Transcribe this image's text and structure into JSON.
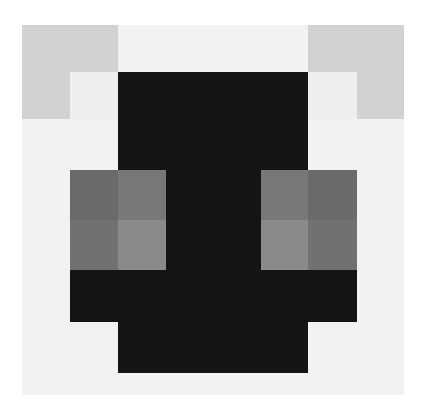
{
  "image": {
    "description": "Pixel-art grayscale icon of a dark face/creature with two gray eyes and light-gray ears",
    "palette": {
      "white": "#ffffff",
      "background": "#f2f2f2",
      "ear": "#d2d2d2",
      "ear_inner": "#eeeeee",
      "body": "#141414",
      "eye_dark": "#6a6a6a",
      "eye_mid": "#787878",
      "eye_light": "#8a8a8a",
      "eye_shade": "#717171"
    },
    "columns_x": [
      22,
      70,
      118,
      166,
      213,
      261,
      308,
      357,
      404
    ],
    "rows_y": [
      25,
      72,
      119,
      170,
      220,
      270,
      322,
      373
    ],
    "pixels": [
      {
        "name": "ear-left-top",
        "c": [
          0,
          2
        ],
        "r": [
          0,
          1
        ],
        "color": "ear"
      },
      {
        "name": "ear-left-side",
        "c": [
          0,
          1
        ],
        "r": [
          1,
          2
        ],
        "color": "ear"
      },
      {
        "name": "ear-left-inner",
        "c": [
          1,
          2
        ],
        "r": [
          1,
          2
        ],
        "color": "ear_inner"
      },
      {
        "name": "ear-right-top",
        "c": [
          6,
          8
        ],
        "r": [
          0,
          1
        ],
        "color": "ear"
      },
      {
        "name": "ear-right-side",
        "c": [
          7,
          8
        ],
        "r": [
          1,
          2
        ],
        "color": "ear"
      },
      {
        "name": "ear-right-inner",
        "c": [
          6,
          7
        ],
        "r": [
          1,
          2
        ],
        "color": "ear_inner"
      },
      {
        "name": "head-top",
        "c": [
          2,
          6
        ],
        "r": [
          1,
          3
        ],
        "color": "body"
      },
      {
        "name": "face-center",
        "c": [
          3,
          5
        ],
        "r": [
          3,
          5
        ],
        "color": "body"
      },
      {
        "name": "eye-left-tl",
        "c": [
          1,
          2
        ],
        "r": [
          3,
          4
        ],
        "color": "eye_dark"
      },
      {
        "name": "eye-left-tr",
        "c": [
          2,
          3
        ],
        "r": [
          3,
          4
        ],
        "color": "eye_mid"
      },
      {
        "name": "eye-left-bl",
        "c": [
          1,
          2
        ],
        "r": [
          4,
          5
        ],
        "color": "eye_shade"
      },
      {
        "name": "eye-left-br",
        "c": [
          2,
          3
        ],
        "r": [
          4,
          5
        ],
        "color": "eye_light"
      },
      {
        "name": "eye-right-tl",
        "c": [
          5,
          6
        ],
        "r": [
          3,
          4
        ],
        "color": "eye_mid"
      },
      {
        "name": "eye-right-tr",
        "c": [
          6,
          7
        ],
        "r": [
          3,
          4
        ],
        "color": "eye_dark"
      },
      {
        "name": "eye-right-bl",
        "c": [
          5,
          6
        ],
        "r": [
          4,
          5
        ],
        "color": "eye_light"
      },
      {
        "name": "eye-right-br",
        "c": [
          6,
          7
        ],
        "r": [
          4,
          5
        ],
        "color": "eye_shade"
      },
      {
        "name": "jaw",
        "c": [
          1,
          7
        ],
        "r": [
          5,
          6
        ],
        "color": "body"
      },
      {
        "name": "chin",
        "c": [
          2,
          6
        ],
        "r": [
          6,
          7
        ],
        "color": "body"
      }
    ]
  }
}
